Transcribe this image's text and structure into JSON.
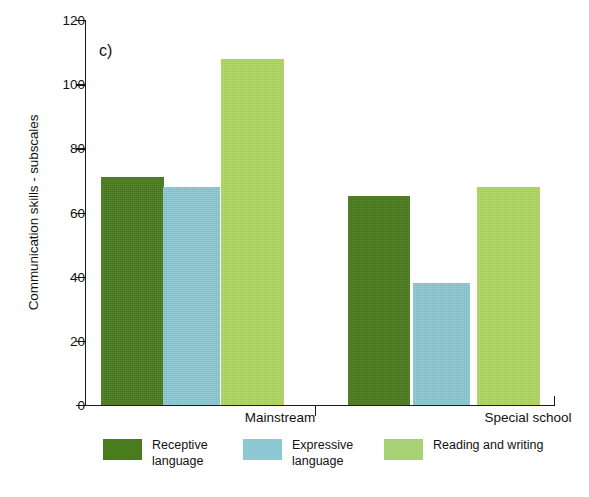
{
  "chart_data": {
    "type": "bar",
    "title": "",
    "panel_label": "c)",
    "xlabel": "",
    "ylabel": "Communication skills - subscales",
    "ylim": [
      0,
      120
    ],
    "yticks": [
      0,
      20,
      40,
      60,
      80,
      100,
      120
    ],
    "ytick_labels": [
      "0",
      "20",
      "40",
      "60",
      "80",
      "100",
      "120"
    ],
    "grid": false,
    "legend_position": "bottom",
    "categories": [
      "Mainstream",
      "Special school"
    ],
    "series": [
      {
        "name": "Receptive language",
        "label_line1": "Receptive",
        "label_line2": "language",
        "color": "#4a7c1e",
        "values": [
          71,
          65
        ]
      },
      {
        "name": "Expressive language",
        "label_line1": "Expressive",
        "label_line2": "language",
        "color": "#8cc9d3",
        "values": [
          68,
          38
        ]
      },
      {
        "name": "Reading and writing",
        "label_line1": "Reading and writing",
        "label_line2": "",
        "color": "#b0d861",
        "legend_color": "#a6d175",
        "values": [
          108,
          68
        ]
      }
    ]
  },
  "axis": {
    "line_color": "#1a1a1a",
    "background": "#ffffff"
  }
}
